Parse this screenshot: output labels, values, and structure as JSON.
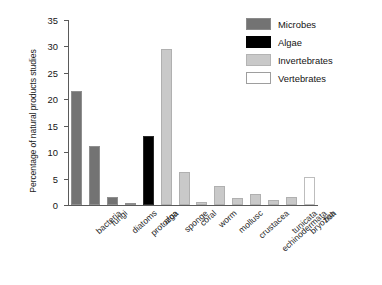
{
  "chart_data": {
    "type": "bar",
    "title": "",
    "xlabel": "",
    "ylabel": "Percentage of natural products studies",
    "ylim": [
      0,
      35
    ],
    "yticks": [
      0,
      5,
      10,
      15,
      20,
      25,
      30,
      35
    ],
    "grid": false,
    "legend_position": "top-right",
    "categories": [
      "bacteria",
      "fungi",
      "diatoms",
      "protozoa",
      "alga",
      "sponge",
      "coral",
      "worm",
      "mollusc",
      "crustacea",
      "echinodermata",
      "tunicata",
      "bryozoa",
      "fish"
    ],
    "values": [
      21.5,
      11.2,
      1.6,
      0.3,
      13.0,
      29.5,
      6.3,
      0.6,
      3.6,
      1.4,
      2.0,
      1.0,
      1.5,
      5.3
    ],
    "groups": [
      "Microbes",
      "Microbes",
      "Microbes",
      "Microbes",
      "Algae",
      "Invertebrates",
      "Invertebrates",
      "Invertebrates",
      "Invertebrates",
      "Invertebrates",
      "Invertebrates",
      "Invertebrates",
      "Invertebrates",
      "Vertebrates"
    ],
    "series": [
      {
        "name": "Microbes",
        "color": "#737373",
        "points": [
          {
            "category": "bacteria",
            "value": 21.5
          },
          {
            "category": "fungi",
            "value": 11.2
          },
          {
            "category": "diatoms",
            "value": 1.6
          },
          {
            "category": "protozoa",
            "value": 0.3
          }
        ]
      },
      {
        "name": "Algae",
        "color": "#000000",
        "points": [
          {
            "category": "alga",
            "value": 13.0
          }
        ]
      },
      {
        "name": "Invertebrates",
        "color": "#c9c9c9",
        "points": [
          {
            "category": "sponge",
            "value": 29.5
          },
          {
            "category": "coral",
            "value": 6.3
          },
          {
            "category": "worm",
            "value": 0.6
          },
          {
            "category": "mollusc",
            "value": 3.6
          },
          {
            "category": "crustacea",
            "value": 1.4
          },
          {
            "category": "echinodermata",
            "value": 2.0
          },
          {
            "category": "tunicata",
            "value": 1.0
          },
          {
            "category": "bryozoa",
            "value": 1.5
          }
        ]
      },
      {
        "name": "Vertebrates",
        "color": "#ffffff",
        "points": [
          {
            "category": "fish",
            "value": 5.3
          }
        ]
      }
    ]
  },
  "legend": {
    "items": [
      {
        "label": "Microbes",
        "swatch": "microbes"
      },
      {
        "label": "Algae",
        "swatch": "algae"
      },
      {
        "label": "Invertebrates",
        "swatch": "invertebrates"
      },
      {
        "label": "Vertebrates",
        "swatch": "vertebrates"
      }
    ]
  },
  "colors": {
    "microbes": "#737373",
    "algae": "#000000",
    "invertebrates": "#c9c9c9",
    "vertebrates": "#ffffff",
    "axis": "#5a5a5a",
    "text": "#141414",
    "background": "#ffffff"
  }
}
